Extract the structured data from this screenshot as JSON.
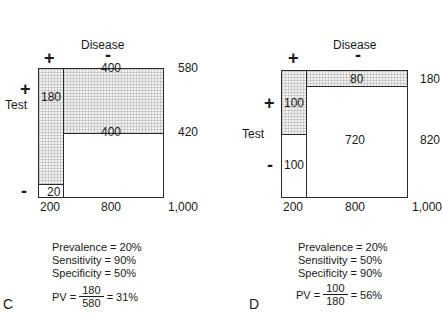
{
  "panels": [
    {
      "id": "C",
      "label": "C",
      "axis_col_title": "Disease",
      "axis_row_title": "Test",
      "col_plus": "+",
      "col_minus": "-",
      "row_plus": "+",
      "row_minus": "-",
      "cells": {
        "true_positive": "180",
        "false_positive": "400",
        "false_negative": "20",
        "true_negative": "400"
      },
      "row_totals": {
        "positive": "580",
        "negative": "420"
      },
      "col_totals": {
        "diseased": "200",
        "healthy": "800",
        "grand": "1,000"
      },
      "stats": {
        "prevalence": "Prevalence = 20%",
        "sensitivity": "Sensitivity  = 90%",
        "specificity": "Specificity  = 50%",
        "pv_prefix": "PV =",
        "pv_numerator": "180",
        "pv_denominator": "580",
        "pv_result": "= 31%"
      }
    },
    {
      "id": "D",
      "label": "D",
      "axis_col_title": "Disease",
      "axis_row_title": "Test",
      "col_plus": "+",
      "col_minus": "-",
      "row_plus": "+",
      "row_minus": "-",
      "cells": {
        "true_positive": "100",
        "false_positive": "80",
        "false_negative": "100",
        "true_negative": "720"
      },
      "row_totals": {
        "positive": "180",
        "negative": "820"
      },
      "col_totals": {
        "diseased": "200",
        "healthy": "800",
        "grand": "1,000"
      },
      "stats": {
        "prevalence": "Prevalence = 20%",
        "sensitivity": "Sensitivity  = 50%",
        "specificity": "Specificity  = 90%",
        "pv_prefix": "PV =",
        "pv_numerator": "100",
        "pv_denominator": "180",
        "pv_result": "= 56%"
      }
    }
  ],
  "colors": {
    "line": "#2a2a2a",
    "shade": "#f1f1f1",
    "text": "#1a1a1a"
  }
}
